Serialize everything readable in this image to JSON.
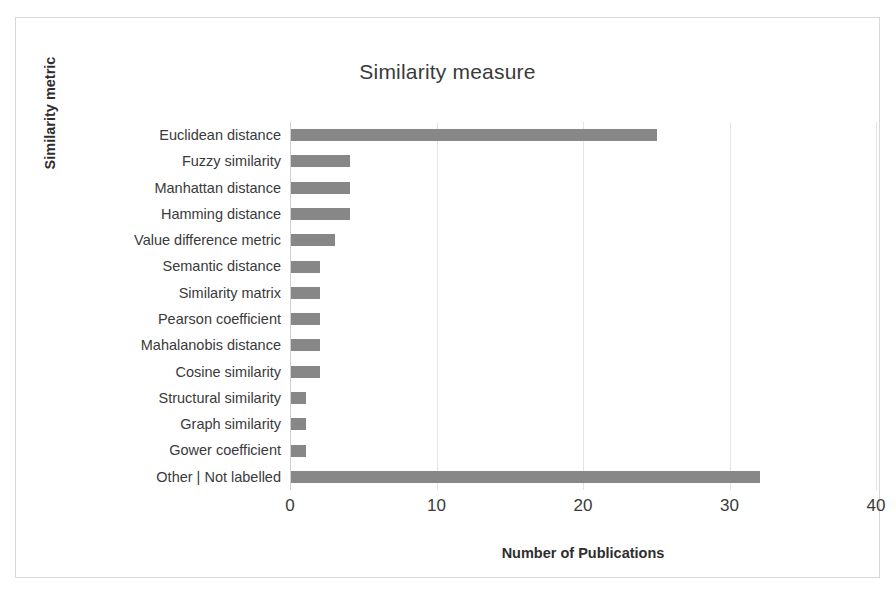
{
  "chart_data": {
    "type": "bar",
    "orientation": "horizontal",
    "title": "Similarity measure",
    "xlabel": "Number of Publications",
    "ylabel": "Similarity metric",
    "xlim": [
      0,
      40
    ],
    "xticks": [
      0,
      10,
      20,
      30,
      40
    ],
    "xtick_labels": [
      "0",
      "10",
      "20",
      "30",
      "40"
    ],
    "grid": "vertical",
    "legend": "none",
    "bar_color": "#878787",
    "categories": [
      "Euclidean distance",
      "Fuzzy similarity",
      "Manhattan distance",
      "Hamming distance",
      "Value difference metric",
      "Semantic distance",
      "Similarity matrix",
      "Pearson coefficient",
      "Mahalanobis distance",
      "Cosine similarity",
      "Structural similarity",
      "Graph similarity",
      "Gower coefficient",
      "Other | Not labelled"
    ],
    "values": [
      25,
      4,
      4,
      4,
      3,
      2,
      2,
      2,
      2,
      2,
      1,
      1,
      1,
      32
    ]
  }
}
